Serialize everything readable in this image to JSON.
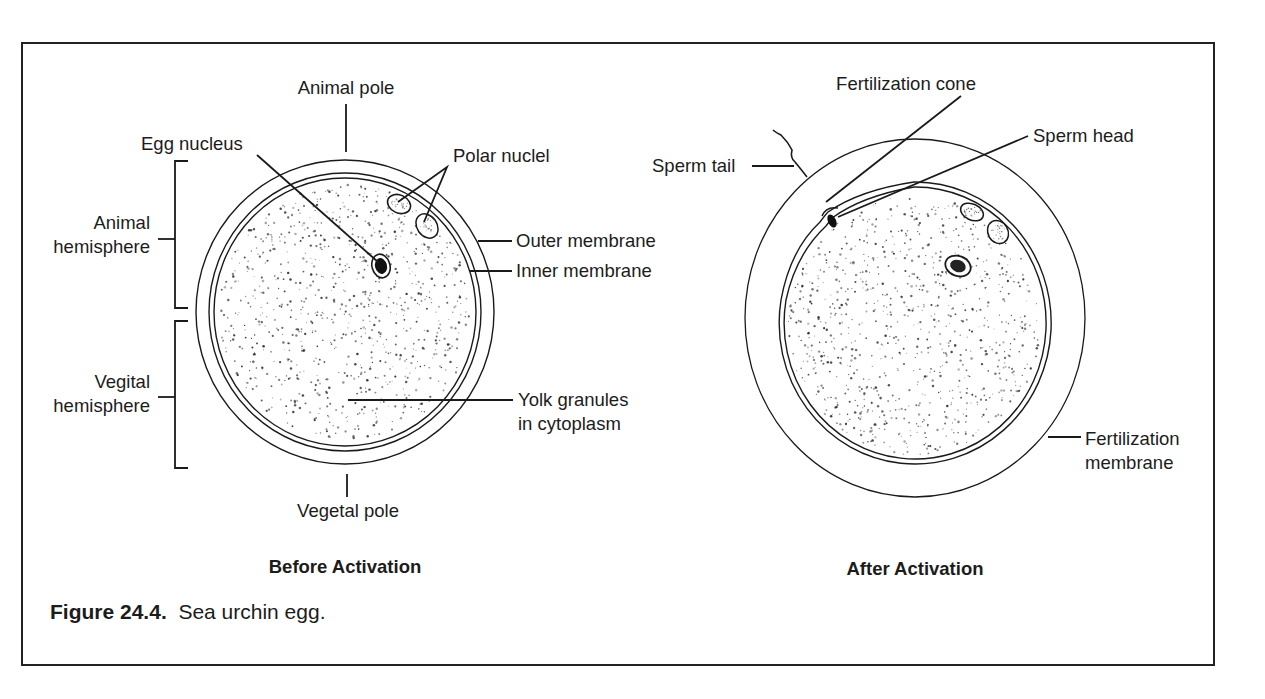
{
  "figure": {
    "number": "Figure 24.4.",
    "caption": "Sea urchin egg."
  },
  "panels": [
    {
      "title": "Before Activation",
      "labels": {
        "animal_pole": "Animal pole",
        "egg_nucleus": "Egg nucleus",
        "polar_nuclei": "Polar nuclel",
        "animal_hemisphere_1": "Animal",
        "animal_hemisphere_2": "hemisphere",
        "vegital_hemisphere_1": "Vegital",
        "vegital_hemisphere_2": "hemisphere",
        "outer_membrane": "Outer membrane",
        "inner_membrane": "Inner membrane",
        "yolk_1": "Yolk granules",
        "yolk_2": "in cytoplasm",
        "vegetal_pole": "Vegetal pole"
      }
    },
    {
      "title": "After Activation",
      "labels": {
        "fertilization_cone": "Fertilization cone",
        "sperm_head": "Sperm head",
        "sperm_tail": "Sperm tail",
        "fertilization_membrane_1": "Fertilization",
        "fertilization_membrane_2": "membrane"
      }
    }
  ],
  "colors": {
    "ink": "#1a1a1a",
    "background": "#ffffff"
  }
}
